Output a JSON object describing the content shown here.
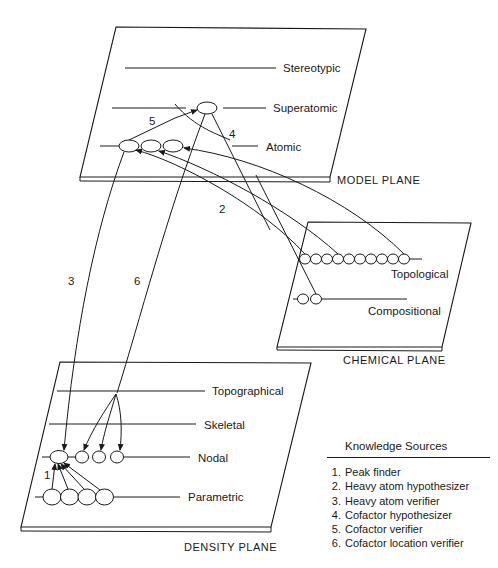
{
  "planes": {
    "model": {
      "label": "MODEL PLANE",
      "levels": [
        "Stereotypic",
        "Superatomic",
        "Atomic"
      ]
    },
    "chemical": {
      "label": "CHEMICAL PLANE",
      "levels": [
        "Topological",
        "Compositional"
      ]
    },
    "density": {
      "label": "DENSITY PLANE",
      "levels": [
        "Topographical",
        "Skeletal",
        "Nodal",
        "Parametric"
      ]
    }
  },
  "arrow_labels": [
    "1",
    "2",
    "3",
    "4",
    "5",
    "6"
  ],
  "legend": {
    "title": "Knowledge Sources",
    "items": [
      {
        "num": "1.",
        "label": "Peak finder"
      },
      {
        "num": "2.",
        "label": "Heavy atom hypothesizer"
      },
      {
        "num": "3.",
        "label": "Heavy atom verifier"
      },
      {
        "num": "4.",
        "label": "Cofactor hypothesizer"
      },
      {
        "num": "5.",
        "label": "Cofactor verifier"
      },
      {
        "num": "6.",
        "label": "Cofactor location verifier"
      }
    ]
  }
}
